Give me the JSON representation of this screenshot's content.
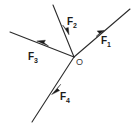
{
  "figure": {
    "kind": "force-vector-diagram",
    "width": 135,
    "height": 131,
    "background_color": "#ffffff",
    "line_color": "#2b2b2b",
    "label_color": "#1a1a1a",
    "origin_label_color": "#3a3a3a"
  },
  "origin": {
    "label": "O",
    "x": 74,
    "y": 57
  },
  "vectors": [
    {
      "id": "f1",
      "label_base": "F",
      "label_sub": "1",
      "label_text": "F1",
      "direction": "up-right",
      "tail_x": 74,
      "tail_y": 57,
      "tip_x": 130,
      "tip_y": 9,
      "arrowhead_x": 101,
      "arrowhead_y": 34,
      "label_x": 101,
      "label_y": 36
    },
    {
      "id": "f2",
      "label_base": "F",
      "label_sub": "2",
      "label_text": "F2",
      "direction": "down-right",
      "tail_x": 53,
      "tail_y": 5,
      "tip_x": 74,
      "tip_y": 57,
      "arrowhead_x": 67,
      "arrowhead_y": 31,
      "label_x": 67,
      "label_y": 17
    },
    {
      "id": "f3",
      "label_base": "F",
      "label_sub": "3",
      "label_text": "F3",
      "direction": "left",
      "tail_x": 74,
      "tail_y": 57,
      "tip_x": 10,
      "tip_y": 32,
      "arrowhead_x": 42,
      "arrowhead_y": 44,
      "label_x": 28,
      "label_y": 52
    },
    {
      "id": "f4",
      "label_base": "F",
      "label_sub": "4",
      "label_text": "F4",
      "direction": "down-left",
      "tail_x": 74,
      "tail_y": 57,
      "tip_x": 32,
      "tip_y": 122,
      "arrowhead_x": 56,
      "arrowhead_y": 90,
      "label_x": 60,
      "label_y": 92
    }
  ]
}
